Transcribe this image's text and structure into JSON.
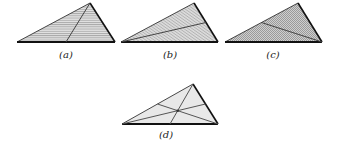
{
  "figure": {
    "colors": {
      "fill": "#d4d4d4",
      "fill_light": "#e6e6e6",
      "stroke": "#1a1a1a",
      "hatch": "#8a8a8a",
      "inner_line": "#555555"
    },
    "panels": [
      {
        "id": "a",
        "label": "(a)",
        "hatch": "horizontal",
        "description": "triangle with median from apex to base"
      },
      {
        "id": "b",
        "label": "(b)",
        "hatch": "diagonal",
        "description": "triangle with median from left vertex to right side"
      },
      {
        "id": "c",
        "label": "(c)",
        "hatch": "crosshatch",
        "description": "triangle with median from right vertex to left side"
      },
      {
        "id": "d",
        "label": "(d)",
        "hatch": "none",
        "description": "triangle with all three medians meeting at centroid"
      }
    ]
  }
}
